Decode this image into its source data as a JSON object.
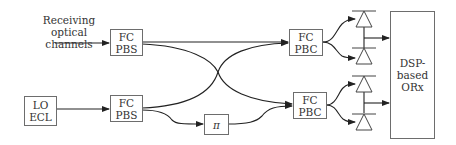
{
  "diagram": {
    "type": "optical coherent receiver block diagram",
    "input_label": {
      "line1": "Receiving optical",
      "line2": "channels"
    },
    "lo": {
      "line1": "LO",
      "line2": "ECL"
    },
    "pbs_top": {
      "line1": "FC",
      "line2": "PBS"
    },
    "pbs_bottom": {
      "line1": "FC",
      "line2": "PBS"
    },
    "phase_shifter": {
      "symbol": "π"
    },
    "pbc_top": {
      "line1": "FC",
      "line2": "PBC"
    },
    "pbc_bottom": {
      "line1": "FC",
      "line2": "PBC"
    },
    "receiver": {
      "line1": "DSP-",
      "line2": "based",
      "line3": "ORx"
    },
    "photodiodes": [
      {
        "name": "photodiode-1"
      },
      {
        "name": "photodiode-2"
      },
      {
        "name": "photodiode-3"
      },
      {
        "name": "photodiode-4"
      }
    ],
    "colors": {
      "line": "#222222",
      "box_border": "#6d6d6d",
      "text": "#333333"
    }
  }
}
